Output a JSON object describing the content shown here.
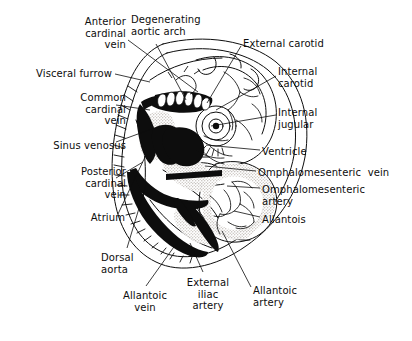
{
  "figure": {
    "background_color": "#ffffff",
    "ink_color": "#0d0d0d",
    "shade_color": "#b9b3ab"
  },
  "labels": [
    {
      "id": "anterior-cardinal-vein",
      "text": "Anterior\ncardinal\nvein",
      "x": 50,
      "y": 16,
      "w": 76,
      "align": "right"
    },
    {
      "id": "degenerating-aortic-arch",
      "text": "Degenerating\naortic arch",
      "x": 131,
      "y": 14,
      "w": 92,
      "align": "left"
    },
    {
      "id": "external-carotid",
      "text": "External carotid",
      "x": 243,
      "y": 38,
      "w": 100,
      "align": "left"
    },
    {
      "id": "visceral-furrow",
      "text": "Visceral furrow",
      "x": 12,
      "y": 68,
      "w": 100,
      "align": "right"
    },
    {
      "id": "internal-carotid",
      "text": "Internal\ncarotid",
      "x": 278,
      "y": 66,
      "w": 64,
      "align": "left"
    },
    {
      "id": "common-cardinal-vein",
      "text": "Common\ncardinal\nvein",
      "x": 50,
      "y": 92,
      "w": 76,
      "align": "right"
    },
    {
      "id": "internal-jugular",
      "text": "Internal\njugular",
      "x": 278,
      "y": 107,
      "w": 64,
      "align": "left"
    },
    {
      "id": "sinus-venosus",
      "text": "Sinus venosus",
      "x": 24,
      "y": 140,
      "w": 102,
      "align": "right"
    },
    {
      "id": "ventricle",
      "text": "Ventricle",
      "x": 262,
      "y": 146,
      "w": 70,
      "align": "left"
    },
    {
      "id": "omphalomesenteric-vein",
      "text": "Omphalomesenteric  vein",
      "x": 258,
      "y": 167,
      "w": 148,
      "align": "left"
    },
    {
      "id": "posterior-cardinal-vein",
      "text": "Posterior\ncardinal\nvein",
      "x": 48,
      "y": 166,
      "w": 78,
      "align": "right"
    },
    {
      "id": "omphalomesenteric-artery",
      "text": "Omphalomesenteric\nartery",
      "x": 262,
      "y": 184,
      "w": 132,
      "align": "left"
    },
    {
      "id": "allantois",
      "text": "Allantois",
      "x": 262,
      "y": 214,
      "w": 70,
      "align": "left"
    },
    {
      "id": "atrium",
      "text": "Atrium",
      "x": 63,
      "y": 212,
      "w": 62,
      "align": "right"
    },
    {
      "id": "dorsal-aorta",
      "text": "Dorsal\naorta",
      "x": 101,
      "y": 252,
      "w": 48,
      "align": "left"
    },
    {
      "id": "external-iliac-artery",
      "text": "External\niliac\nartery",
      "x": 181,
      "y": 277,
      "w": 54,
      "align": "center"
    },
    {
      "id": "allantoic-artery",
      "text": "Allantoic\nartery",
      "x": 253,
      "y": 285,
      "w": 56,
      "align": "left"
    },
    {
      "id": "allantoic-vein",
      "text": "Allantoic\nvein",
      "x": 117,
      "y": 290,
      "w": 56,
      "align": "center"
    }
  ],
  "leaders": [
    {
      "id": "leader-anterior-cardinal-vein",
      "path": "M128,40 L198,92"
    },
    {
      "id": "leader-degenerating-aortic-arch",
      "path": "M156,44 L186,100"
    },
    {
      "id": "leader-external-carotid",
      "path": "M241,46 L207,103"
    },
    {
      "id": "leader-visceral-furrow",
      "path": "M115,74 L150,82"
    },
    {
      "id": "leader-internal-carotid",
      "path": "M276,76 L216,110"
    },
    {
      "id": "leader-common-cardinal-vein",
      "path": "M116,105 L150,110"
    },
    {
      "id": "leader-internal-jugular",
      "path": "M276,115 L211,126"
    },
    {
      "id": "leader-sinus-venosus",
      "path": "M116,142 L160,126"
    },
    {
      "id": "leader-ventricle",
      "path": "M260,150 L206,145"
    },
    {
      "id": "leader-omphalomesenteric-vein",
      "path": "M256,171 L205,166"
    },
    {
      "id": "leader-posterior-cardinal-vein",
      "path": "M116,178 L143,162"
    },
    {
      "id": "leader-omphalomesenteric-artery",
      "path": "M260,188 L227,186"
    },
    {
      "id": "leader-allantois",
      "path": "M260,217 L234,211"
    },
    {
      "id": "leader-atrium",
      "path": "M118,214 L146,155"
    },
    {
      "id": "leader-dorsal-aorta",
      "path": "M127,248 L146,185"
    },
    {
      "id": "leader-external-iliac-artery",
      "path": "M203,272 L190,243"
    },
    {
      "id": "leader-allantoic-artery",
      "path": "M251,287 L222,231"
    },
    {
      "id": "leader-allantoic-vein",
      "path": "M146,286 L176,244"
    }
  ]
}
